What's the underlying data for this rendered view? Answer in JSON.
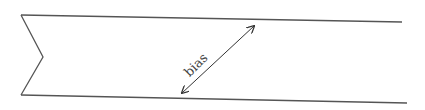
{
  "diagram": {
    "type": "fabric-strip-bias-illustration",
    "label": "bias",
    "colors": {
      "stroke": "#555555",
      "arrow": "#333333",
      "background": "#ffffff"
    }
  }
}
